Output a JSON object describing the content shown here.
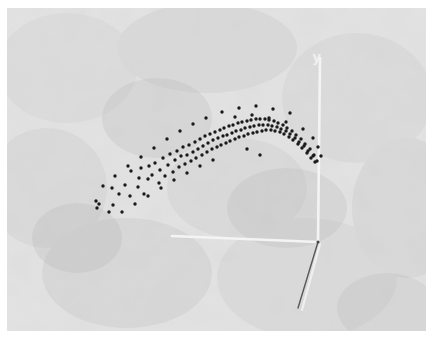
{
  "figure": {
    "type": "scatter-3d",
    "background_color": "#b9b9b9",
    "margin_color": "#ffffff",
    "point_color": "#1a1a1a",
    "axis_color": "#f4f4f4",
    "z_axis_color": "#4a4a4a"
  },
  "axes": {
    "y_label": "y",
    "x_label": "",
    "z_label": "",
    "origin": {
      "x": 311,
      "y": 234
    },
    "y_axis": {
      "x1": 311,
      "y1": 234,
      "x2": 313,
      "y2": 50
    },
    "x_axis": {
      "x1": 165,
      "y1": 228,
      "x2": 311,
      "y2": 234
    },
    "z_axis": {
      "x1": 311,
      "y1": 234,
      "x2": 291,
      "y2": 300
    },
    "z_axis_shadow": {
      "x1": 313,
      "y1": 236,
      "x2": 295,
      "y2": 302
    }
  },
  "chart_data": {
    "type": "scatter",
    "title": "",
    "xlabel": "",
    "ylabel": "y",
    "zlabel": "",
    "grid": false,
    "legend": null,
    "axis_ranges": {
      "x": [
        0,
        1
      ],
      "y": [
        0,
        1
      ],
      "z": [
        0,
        1
      ]
    },
    "n_points": 146,
    "points_px": [
      [
        89,
        193
      ],
      [
        92,
        196
      ],
      [
        105,
        180
      ],
      [
        106,
        197
      ],
      [
        112,
        186
      ],
      [
        118,
        177
      ],
      [
        123,
        188
      ],
      [
        124,
        163
      ],
      [
        131,
        179
      ],
      [
        132,
        170
      ],
      [
        134,
        160
      ],
      [
        137,
        186
      ],
      [
        141,
        171
      ],
      [
        142,
        158
      ],
      [
        145,
        167
      ],
      [
        148,
        155
      ],
      [
        152,
        175
      ],
      [
        153,
        162
      ],
      [
        156,
        150
      ],
      [
        158,
        168
      ],
      [
        161,
        157
      ],
      [
        163,
        146
      ],
      [
        166,
        164
      ],
      [
        168,
        152
      ],
      [
        170,
        143
      ],
      [
        172,
        159
      ],
      [
        174,
        148
      ],
      [
        176,
        139
      ],
      [
        178,
        156
      ],
      [
        180,
        147
      ],
      [
        182,
        137
      ],
      [
        184,
        153
      ],
      [
        186,
        144
      ],
      [
        188,
        134
      ],
      [
        189,
        150
      ],
      [
        191,
        141
      ],
      [
        193,
        131
      ],
      [
        195,
        147
      ],
      [
        196,
        138
      ],
      [
        198,
        128
      ],
      [
        200,
        144
      ],
      [
        201,
        135
      ],
      [
        203,
        126
      ],
      [
        205,
        141
      ],
      [
        206,
        132
      ],
      [
        208,
        124
      ],
      [
        210,
        139
      ],
      [
        211,
        130
      ],
      [
        213,
        122
      ],
      [
        214,
        137
      ],
      [
        216,
        128
      ],
      [
        217,
        120
      ],
      [
        219,
        135
      ],
      [
        220,
        127
      ],
      [
        222,
        118
      ],
      [
        223,
        133
      ],
      [
        225,
        125
      ],
      [
        226,
        117
      ],
      [
        228,
        131
      ],
      [
        229,
        123
      ],
      [
        231,
        115
      ],
      [
        232,
        129
      ],
      [
        234,
        122
      ],
      [
        235,
        114
      ],
      [
        237,
        128
      ],
      [
        238,
        120
      ],
      [
        240,
        113
      ],
      [
        241,
        126
      ],
      [
        243,
        119
      ],
      [
        244,
        112
      ],
      [
        246,
        125
      ],
      [
        247,
        118
      ],
      [
        249,
        111
      ],
      [
        250,
        124
      ],
      [
        252,
        117
      ],
      [
        253,
        111
      ],
      [
        255,
        123
      ],
      [
        256,
        117
      ],
      [
        258,
        111
      ],
      [
        259,
        122
      ],
      [
        261,
        117
      ],
      [
        262,
        112
      ],
      [
        264,
        122
      ],
      [
        265,
        118
      ],
      [
        267,
        113
      ],
      [
        268,
        123
      ],
      [
        270,
        119
      ],
      [
        271,
        115
      ],
      [
        273,
        124
      ],
      [
        274,
        121
      ],
      [
        276,
        117
      ],
      [
        277,
        126
      ],
      [
        279,
        123
      ],
      [
        280,
        120
      ],
      [
        282,
        129
      ],
      [
        283,
        126
      ],
      [
        285,
        123
      ],
      [
        286,
        132
      ],
      [
        288,
        130
      ],
      [
        289,
        127
      ],
      [
        291,
        136
      ],
      [
        292,
        134
      ],
      [
        294,
        131
      ],
      [
        295,
        140
      ],
      [
        297,
        138
      ],
      [
        298,
        136
      ],
      [
        300,
        145
      ],
      [
        301,
        143
      ],
      [
        303,
        141
      ],
      [
        304,
        150
      ],
      [
        306,
        148
      ],
      [
        307,
        147
      ],
      [
        308,
        154
      ],
      [
        310,
        153
      ],
      [
        215,
        104
      ],
      [
        232,
        100
      ],
      [
        249,
        98
      ],
      [
        266,
        101
      ],
      [
        283,
        105
      ],
      [
        199,
        110
      ],
      [
        186,
        116
      ],
      [
        173,
        123
      ],
      [
        160,
        131
      ],
      [
        147,
        140
      ],
      [
        134,
        149
      ],
      [
        121,
        158
      ],
      [
        108,
        168
      ],
      [
        96,
        178
      ],
      [
        228,
        109
      ],
      [
        245,
        107
      ],
      [
        262,
        110
      ],
      [
        279,
        114
      ],
      [
        296,
        121
      ],
      [
        306,
        130
      ],
      [
        311,
        139
      ],
      [
        314,
        148
      ],
      [
        240,
        141
      ],
      [
        253,
        147
      ],
      [
        206,
        152
      ],
      [
        193,
        158
      ],
      [
        180,
        165
      ],
      [
        167,
        172
      ],
      [
        154,
        180
      ],
      [
        141,
        188
      ],
      [
        128,
        196
      ],
      [
        115,
        204
      ],
      [
        102,
        204
      ],
      [
        90,
        200
      ]
    ]
  }
}
